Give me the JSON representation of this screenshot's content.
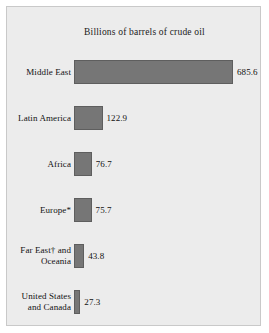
{
  "panel": {
    "background_color": "#ececec",
    "border_color": "#c9c9c9"
  },
  "chart_data": {
    "type": "bar",
    "orientation": "horizontal",
    "title": "Billions of barrels of crude oil",
    "xlabel": "",
    "ylabel": "",
    "grid": false,
    "legend": "none",
    "xlim": [
      0,
      685.6
    ],
    "bar_color": "#767676",
    "bar_border_color": "#5e5e5e",
    "categories": [
      "Middle East",
      "Latin America",
      "Africa",
      "Europe*",
      "Far East† and\nOceania",
      "United States\nand Canada"
    ],
    "values": [
      685.6,
      122.9,
      76.7,
      75.7,
      43.8,
      27.3
    ],
    "value_labels": [
      "685.6",
      "122.9",
      "76.7",
      "75.7",
      "43.8",
      "27.3"
    ]
  }
}
